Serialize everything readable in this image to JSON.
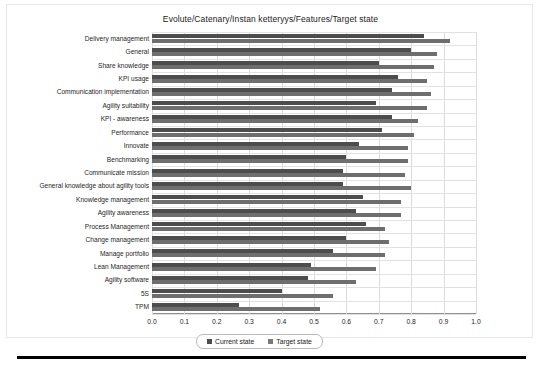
{
  "chart": {
    "title": "Evolute/Catenary/Instan ketteryys/Features/Target state"
  },
  "legend": {
    "current_label": "Current state",
    "target_label": "Target state",
    "current_swatch": "current-state-swatch",
    "target_swatch": "target-state-swatch"
  },
  "colors": {
    "current_state": "#4d4d4d",
    "target_state": "#6e6e6e",
    "grid": "#dcdcdc",
    "axis": "#8f8f8f",
    "rule": "#000000"
  },
  "chart_data": {
    "type": "bar",
    "orientation": "horizontal",
    "title": "Evolute/Catenary/Instan ketteryys/Features/Target state",
    "xlabel": "",
    "ylabel": "",
    "xlim": [
      0.0,
      1.0
    ],
    "grid": true,
    "legend_position": "bottom",
    "xticks": [
      "0.0",
      "0.1",
      "0.2",
      "0.3",
      "0.4",
      "0.5",
      "0.6",
      "0.7",
      "0.8",
      "0.9",
      "1.0"
    ],
    "xtick_values": [
      0.0,
      0.1,
      0.2,
      0.3,
      0.4,
      0.5,
      0.6,
      0.7,
      0.8,
      0.9,
      1.0
    ],
    "categories": [
      "Delivery management",
      "General",
      "Share knowledge",
      "KPI usage",
      "Communication implementation",
      "Agility suitability",
      "KPI - awareness",
      "Performance",
      "Innovate",
      "Benchmarking",
      "Communicate mission",
      "General knowledge about agility tools",
      "Knowledge management",
      "Agility awareness",
      "Process Management",
      "Change management",
      "Manage portfolio",
      "Lean Management",
      "Agility software",
      "5S",
      "TPM"
    ],
    "series": [
      {
        "name": "Current state",
        "color": "#4d4d4d",
        "values": [
          0.84,
          0.8,
          0.7,
          0.76,
          0.74,
          0.69,
          0.74,
          0.71,
          0.64,
          0.6,
          0.59,
          0.59,
          0.65,
          0.63,
          0.66,
          0.6,
          0.56,
          0.49,
          0.48,
          0.4,
          0.27
        ]
      },
      {
        "name": "Target state",
        "color": "#6e6e6e",
        "values": [
          0.92,
          0.88,
          0.87,
          0.85,
          0.86,
          0.85,
          0.82,
          0.81,
          0.79,
          0.79,
          0.78,
          0.8,
          0.77,
          0.77,
          0.72,
          0.73,
          0.72,
          0.69,
          0.63,
          0.56,
          0.52
        ]
      }
    ]
  }
}
